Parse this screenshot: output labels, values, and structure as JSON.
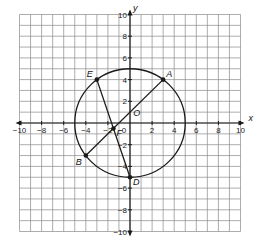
{
  "diagram": {
    "type": "coordinate-plane",
    "axes": {
      "x_label": "x",
      "y_label": "y",
      "x_range": [
        -10,
        10
      ],
      "y_range": [
        -10,
        10
      ],
      "grid": true,
      "x_tick_labels": [
        "-10",
        "-8",
        "-6",
        "-4",
        "-2",
        "2",
        "4",
        "6",
        "8",
        "10"
      ],
      "y_tick_labels": [
        "10",
        "8",
        "6",
        "4",
        "2",
        "-2",
        "-4",
        "-6",
        "-8",
        "-10"
      ],
      "origin_tick_label": "0"
    },
    "circle": {
      "center_label": "O",
      "center": [
        0,
        0
      ],
      "radius": 5
    },
    "points": [
      {
        "label": "A",
        "x": 3,
        "y": 4
      },
      {
        "label": "E",
        "x": -3,
        "y": 4
      },
      {
        "label": "B",
        "x": -4,
        "y": -3
      },
      {
        "label": "D",
        "x": 0,
        "y": -5
      },
      {
        "label": "F",
        "x": -1.5,
        "y": -0.5
      }
    ],
    "segments": [
      {
        "from": "A",
        "to": "B"
      },
      {
        "from": "E",
        "to": "D"
      }
    ],
    "colors": {
      "grid": "#8a8a8a",
      "lines": "#1a1a1a",
      "background": "#ffffff"
    }
  }
}
